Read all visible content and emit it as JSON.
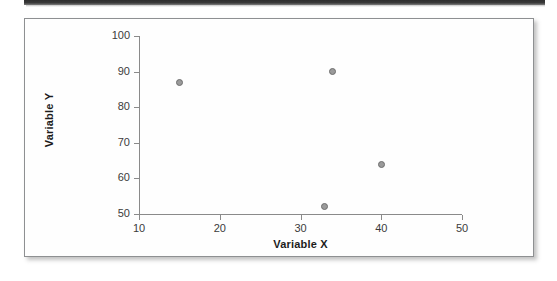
{
  "figure": {
    "background_color": "#fefefe",
    "border_color": "#8e9092",
    "top_rule_color": "#2e2e2e"
  },
  "chart_data": {
    "type": "scatter",
    "title": "",
    "subtitle": "",
    "xlabel": "Variable X",
    "ylabel": "Variable Y",
    "xlim": [
      10,
      50
    ],
    "ylim": [
      50,
      100
    ],
    "xticks": [
      10,
      20,
      30,
      40,
      50
    ],
    "yticks": [
      50,
      60,
      70,
      80,
      90,
      100
    ],
    "xtick_labels": [
      "10",
      "20",
      "30",
      "40",
      "50"
    ],
    "ytick_labels": [
      "50",
      "60",
      "70",
      "80",
      "90",
      "100"
    ],
    "grid": false,
    "legend": null,
    "legend_position": "none",
    "marker": {
      "shape": "circle",
      "fill_color": "#9a9a9a",
      "edge_color": "#6e6e6e",
      "size_px": 7
    },
    "axis_color": "#8a8a8a",
    "series": [
      {
        "name": "observations",
        "points": [
          {
            "x": 15,
            "y": 87
          },
          {
            "x": 34,
            "y": 90
          },
          {
            "x": 40,
            "y": 64
          },
          {
            "x": 33,
            "y": 52
          }
        ]
      }
    ]
  }
}
